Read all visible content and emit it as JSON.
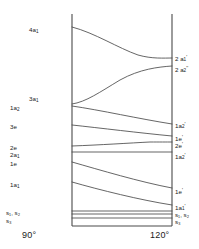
{
  "figure": {
    "kind": "walsh-correlation-diagram",
    "axis": {
      "left_angle": "90°",
      "right_angle": "120°",
      "left_x": 72,
      "right_x": 172,
      "top_y": 14,
      "bottom_y": 226
    },
    "line_color": "#4a4a4a"
  },
  "left_labels": [
    {
      "id": "4a1",
      "text": "4a",
      "sub": "1",
      "x": 29,
      "y": 27
    },
    {
      "id": "3a1",
      "text": "3a",
      "sub": "1",
      "x": 29,
      "y": 96
    },
    {
      "id": "1a2",
      "text": "1a",
      "sub": "2",
      "x": 10,
      "y": 105
    },
    {
      "id": "3e",
      "text": "3e",
      "sub": "",
      "x": 10,
      "y": 124
    },
    {
      "id": "2e",
      "text": "2e",
      "sub": "",
      "x": 10,
      "y": 145
    },
    {
      "id": "2a1",
      "text": "2a",
      "sub": "1",
      "x": 10,
      "y": 152
    },
    {
      "id": "1e",
      "text": "1e",
      "sub": "",
      "x": 10,
      "y": 161
    },
    {
      "id": "1a1",
      "text": "1a",
      "sub": "1",
      "x": 10,
      "y": 182
    },
    {
      "id": "s1s2",
      "text": "s₁, s₂",
      "sub": "",
      "x": 6,
      "y": 210
    },
    {
      "id": "s3",
      "text": "s₃",
      "sub": "",
      "x": 6,
      "y": 218
    }
  ],
  "right_labels": [
    {
      "id": "2a1p",
      "text": "2 a",
      "sub": "1",
      "prime": "'",
      "x": 175,
      "y": 55
    },
    {
      "id": "2a2pp",
      "text": "2 a",
      "sub": "2",
      "prime": "''",
      "x": 175,
      "y": 66
    },
    {
      "id": "1a2p",
      "text": "1a",
      "sub": "2",
      "prime": "'",
      "x": 175,
      "y": 122
    },
    {
      "id": "1ep",
      "text": "1e",
      "sub": "",
      "prime": "'",
      "x": 175,
      "y": 135
    },
    {
      "id": "2ep",
      "text": "2e",
      "sub": "",
      "prime": "'",
      "x": 175,
      "y": 142
    },
    {
      "id": "1a2p2",
      "text": "1a",
      "sub": "2",
      "prime": "'",
      "x": 175,
      "y": 153
    },
    {
      "id": "1ep2",
      "text": "1e",
      "sub": "",
      "prime": "'",
      "x": 175,
      "y": 188
    },
    {
      "id": "1a1p",
      "text": "1a",
      "sub": "1",
      "prime": "'",
      "x": 175,
      "y": 204
    },
    {
      "id": "s1s2r",
      "text": "s₁, s₂",
      "sub": "",
      "prime": "",
      "x": 175,
      "y": 212
    },
    {
      "id": "s3r",
      "text": "s₃",
      "sub": "",
      "prime": "",
      "x": 175,
      "y": 219
    }
  ],
  "axis_labels": {
    "left": {
      "text": "90°",
      "x": 22,
      "y": 230
    },
    "right": {
      "text": "120°",
      "x": 150,
      "y": 230
    }
  },
  "chart_data": {
    "type": "line",
    "title": "",
    "xlabel": "",
    "ylabel": "",
    "x": [
      "90°",
      "120°"
    ],
    "xlim": [
      90,
      120
    ],
    "grid": false,
    "legend": "none",
    "note": "Orbital energy correlation (Walsh) diagram; vertical axis is orbital energy, increasing upward. Curve y-values are given in screenshot pixel coordinates (smaller y = higher energy).",
    "series": [
      {
        "name": "4a1 -> 2a1'",
        "left_label": "4a1",
        "right_label": "2a1'",
        "path": "M 72,27 C 95,33 118,48 138,55 C 152,59 164,58 172,58"
      },
      {
        "name": "3a1 -> 2a2''",
        "left_label": "3a1",
        "right_label": "2a2''",
        "path": "M 72,104 C 86,102 100,92 120,80 C 140,69 158,67 172,66"
      },
      {
        "name": "1a2 -> 1a2'",
        "left_label": "1a2",
        "right_label": "1a2'",
        "path": "M 72,106 C 100,110 140,119 172,124"
      },
      {
        "name": "3e -> 1e'",
        "left_label": "3e",
        "right_label": "1e'",
        "path": "M 72,125 C 100,128 140,133 172,136"
      },
      {
        "name": "2e -> 2e'",
        "left_label": "2e",
        "right_label": "2e'",
        "path": "M 72,146 C 100,145 130,143 150,142 C 160,142 166,142 172,142"
      },
      {
        "name": "2a1 -> 1a2'",
        "left_label": "2a1",
        "right_label": "1a2'",
        "path": "M 72,152 L 172,152"
      },
      {
        "name": "1e -> 1e'",
        "left_label": "1e",
        "right_label": "1e'",
        "path": "M 72,162 C 100,170 140,182 172,188"
      },
      {
        "name": "1a1 -> 1a1'",
        "left_label": "1a1",
        "right_label": "1a1'",
        "path": "M 72,182 C 100,190 140,200 172,205"
      },
      {
        "name": "s1 (core)",
        "left_label": "s1",
        "right_label": "s1",
        "path": "M 72,211 L 172,211"
      },
      {
        "name": "s2 (core)",
        "left_label": "s2",
        "right_label": "s2",
        "path": "M 72,214 L 172,214"
      },
      {
        "name": "s3 (core)",
        "left_label": "s3",
        "right_label": "s3",
        "path": "M 72,218 L 172,218"
      }
    ]
  }
}
